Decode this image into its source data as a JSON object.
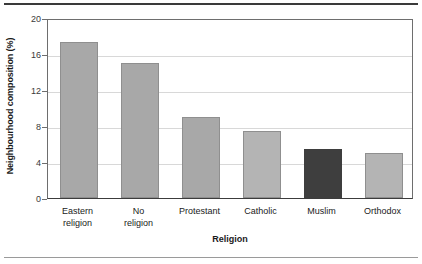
{
  "chart_data": {
    "type": "bar",
    "title": "",
    "xlabel": "Religion",
    "ylabel": "Neighbourhood composition (%)",
    "categories": [
      "Eastern religion",
      "No religion",
      "Protestant",
      "Catholic",
      "Muslim",
      "Orthodox"
    ],
    "category_lines": [
      [
        "Eastern",
        "religion"
      ],
      [
        "No",
        "religion"
      ],
      [
        "Protestant"
      ],
      [
        "Catholic"
      ],
      [
        "Muslim"
      ],
      [
        "Orthodox"
      ]
    ],
    "values": [
      17.3,
      15.0,
      9.0,
      7.4,
      5.4,
      5.0
    ],
    "bar_colors": [
      "#a8a8a8",
      "#a8a8a8",
      "#a8a8a8",
      "#b4b4b4",
      "#3e3e3e",
      "#b4b4b4"
    ],
    "ylim": [
      0,
      20
    ],
    "yticks": [
      0,
      4,
      8,
      12,
      16,
      20
    ],
    "ytick_labels": [
      "0",
      "4",
      "8",
      "12",
      "16",
      "20"
    ],
    "grid": true,
    "legend": null,
    "highlight_category": "Muslim",
    "colors": {
      "bar_default": "#a8a8a8",
      "bar_highlight": "#3e3e3e",
      "bar_edge": "#8f8f8f",
      "gridline": "#d8d8d8",
      "axis": "#6e6e6e",
      "text": "#1a1a1a",
      "rule_top": "#3a3a3a",
      "rule_bottom": "#9a9a9a"
    }
  }
}
